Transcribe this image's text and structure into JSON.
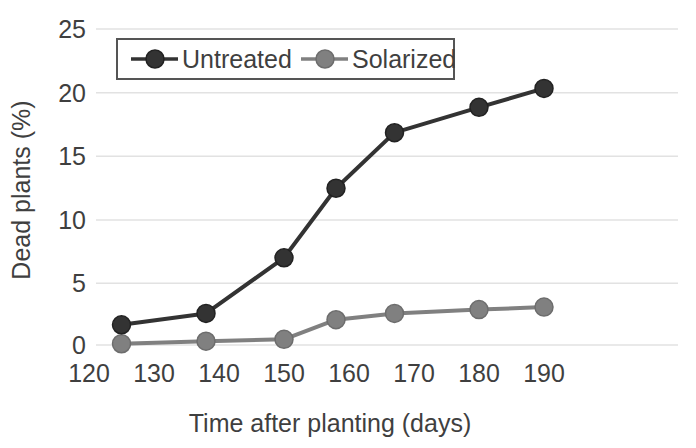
{
  "chart_data": {
    "type": "line",
    "title": "",
    "xlabel": "Time after planting (days)",
    "ylabel": "Dead plants (%)",
    "xlim": [
      120,
      190
    ],
    "ylim": [
      0,
      25
    ],
    "xticks": [
      120,
      130,
      140,
      150,
      160,
      170,
      180,
      190
    ],
    "yticks": [
      0,
      5,
      10,
      15,
      20,
      25
    ],
    "grid": "horizontal",
    "legend_position": "top-center",
    "x": [
      125,
      138,
      150,
      158,
      167,
      180,
      190
    ],
    "series": [
      {
        "name": "Untreated",
        "color": "#333333",
        "marker": "circle",
        "values": [
          1.6,
          2.5,
          6.9,
          12.4,
          16.8,
          18.8,
          20.3
        ]
      },
      {
        "name": "Solarized",
        "color": "#808080",
        "marker": "circle",
        "values": [
          0.1,
          0.3,
          0.45,
          2.0,
          2.5,
          2.8,
          3.0
        ]
      }
    ]
  },
  "axes": {
    "y_tick_labels": [
      "25",
      "20",
      "15",
      "10",
      "5",
      "0"
    ],
    "x_tick_labels": [
      "120",
      "130",
      "140",
      "150",
      "160",
      "170",
      "180",
      "190"
    ],
    "x_title": "Time after planting (days)",
    "y_title": "Dead plants (%)"
  },
  "legend": {
    "entries": [
      {
        "label": "Untreated",
        "color": "#333333"
      },
      {
        "label": "Solarized",
        "color": "#808080"
      }
    ]
  },
  "colors": {
    "untreated": "#333333",
    "solarized": "#808080",
    "grid": "#e2e2e2",
    "text": "#3f3f3f",
    "legend_border": "#555555",
    "background": "#ffffff"
  }
}
